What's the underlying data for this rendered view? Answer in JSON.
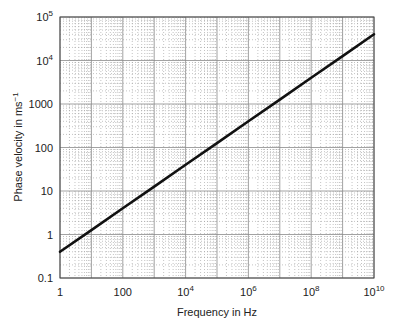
{
  "chart_data": {
    "type": "line",
    "title": "",
    "xlabel": "Frequency in Hz",
    "ylabel": "Phase velocity in ms⁻¹",
    "xscale": "log",
    "yscale": "log",
    "xlim": [
      1,
      10000000000
    ],
    "ylim": [
      0.1,
      100000
    ],
    "x_tick_labels": [
      {
        "value": 1,
        "label": "1"
      },
      {
        "value": 100,
        "label": "100"
      },
      {
        "value": 10000,
        "base": "10",
        "exp": "4"
      },
      {
        "value": 1000000,
        "base": "10",
        "exp": "6"
      },
      {
        "value": 100000000,
        "base": "10",
        "exp": "8"
      },
      {
        "value": 10000000000,
        "base": "10",
        "exp": "10"
      }
    ],
    "y_tick_labels": [
      {
        "value": 0.1,
        "label": "0.1"
      },
      {
        "value": 1,
        "label": "1"
      },
      {
        "value": 10,
        "label": "10"
      },
      {
        "value": 100,
        "label": "100"
      },
      {
        "value": 1000,
        "label": "1000"
      },
      {
        "value": 10000,
        "base": "10",
        "exp": "4"
      },
      {
        "value": 100000,
        "base": "10",
        "exp": "5"
      }
    ],
    "grid": true,
    "grid_style": "major solid gray per decade, minor dotted",
    "legend": null,
    "series": [
      {
        "name": "Phase velocity",
        "color": "#111111",
        "x": [
          1,
          10,
          100,
          1000,
          10000,
          100000,
          1000000,
          10000000,
          100000000,
          1000000000,
          10000000000
        ],
        "values": [
          0.4,
          1.26,
          4,
          12.6,
          40,
          126,
          400,
          1260,
          4000,
          12600,
          40000
        ]
      }
    ]
  }
}
